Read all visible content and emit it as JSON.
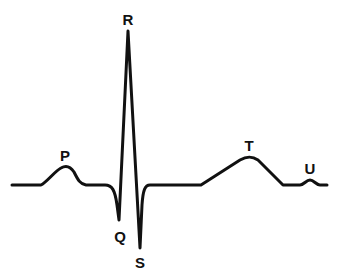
{
  "diagram": {
    "title": "",
    "stroke_color": "#111111",
    "labels": [
      {
        "id": "P",
        "text": "P",
        "x": 65,
        "y": 155
      },
      {
        "id": "Q",
        "text": "Q",
        "x": 120,
        "y": 236
      },
      {
        "id": "R",
        "text": "R",
        "x": 128,
        "y": 19
      },
      {
        "id": "S",
        "text": "S",
        "x": 140,
        "y": 262
      },
      {
        "id": "T",
        "text": "T",
        "x": 249,
        "y": 145
      },
      {
        "id": "U",
        "text": "U",
        "x": 310,
        "y": 168
      }
    ]
  }
}
